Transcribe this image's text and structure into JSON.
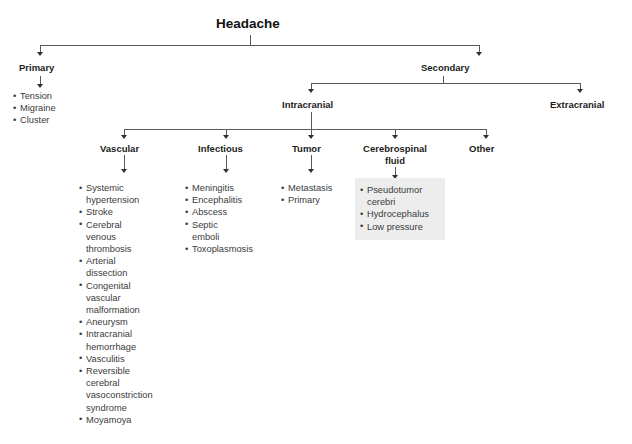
{
  "diagram": {
    "title": "Headache",
    "type": "tree",
    "nodes": {
      "root": "Headache",
      "primary": "Primary",
      "secondary": "Secondary",
      "intracranial": "Intracranial",
      "extracranial": "Extracranial",
      "vascular": "Vascular",
      "infectious": "Infectious",
      "tumor": "Tumor",
      "csf_line1": "Cerebrospinal",
      "csf_line2": "fluid",
      "other": "Other"
    },
    "lists": {
      "primary": [
        "Tension",
        "Migraine",
        "Cluster"
      ],
      "vascular": [
        "Systemic hypertension",
        "Stroke",
        "Cerebral venous thrombosis",
        "Arterial dissection",
        "Congenital vascular malformation",
        "Aneurysm",
        "Intracranial hemorrhage",
        "Vasculitis",
        "Reversible cerebral vasoconstriction syndrome",
        "Moyamoya"
      ],
      "infectious": [
        "Meningitis",
        "Encephalitis",
        "Abscess",
        "Septic emboli",
        "Toxoplasmosis"
      ],
      "tumor": [
        "Metastasis",
        "Primary"
      ],
      "csf": [
        "Pseudotumor cerebri",
        "Hydrocephalus",
        "Low pressure"
      ]
    },
    "colors": {
      "text": "#1c1c1c",
      "list_text": "#3b3b3b",
      "connector": "#555b5f",
      "arrow": "#2d3133",
      "highlight_background": "#ededed",
      "page_background": "#ffffff"
    }
  }
}
